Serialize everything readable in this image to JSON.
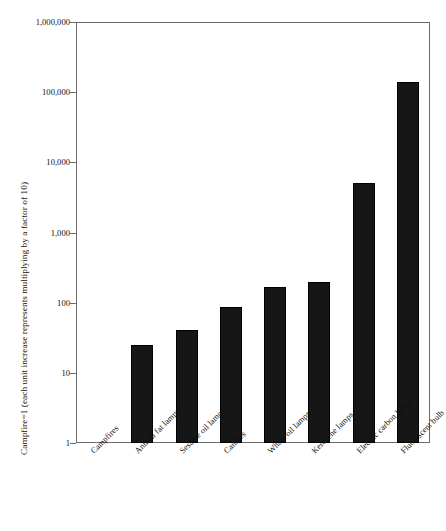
{
  "chart_data": {
    "type": "bar",
    "title": "",
    "xlabel": "",
    "ylabel": "Campfire=1 (each unit increase represents multiplying by a factor of 10)",
    "yscale": "log",
    "ylim": [
      1,
      1000000
    ],
    "grid": false,
    "legend": null,
    "ytick_labels": [
      "1,000,000",
      "100,000",
      "10,000",
      "1,000",
      "100",
      "10",
      "1"
    ],
    "ytick_values": [
      1000000,
      100000,
      10000,
      1000,
      100,
      10,
      1
    ],
    "categories": [
      "Campfires",
      "Animal fat lamps",
      "Sesame oil lamps",
      "Candles",
      "Whale oil lamps",
      "Kerosene lamps",
      "Electric carbon lamps",
      "Fluorescent bulb"
    ],
    "values": [
      1,
      25,
      41,
      88,
      170,
      200,
      5000,
      140000
    ],
    "bar_color": "#161616"
  },
  "axis": {
    "frame_color": "#6b6b6b"
  }
}
